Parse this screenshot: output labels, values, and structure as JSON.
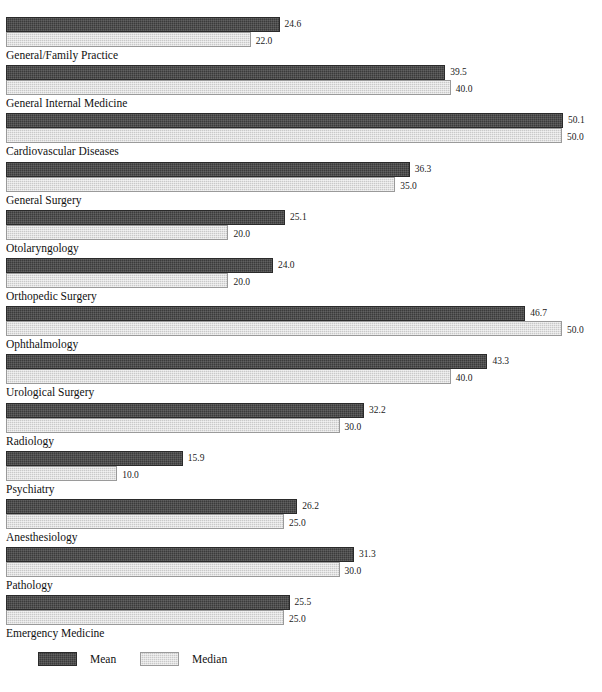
{
  "chart_data": {
    "type": "bar",
    "title": "",
    "subtitle": "",
    "xlabel": "",
    "ylabel": "",
    "orientation": "horizontal",
    "grid": false,
    "legend_position": "bottom-left",
    "xlim": [
      0,
      50.1
    ],
    "value_format": "one-decimal",
    "categories": [
      "General/Family Practice",
      "General Internal Medicine",
      "Cardiovascular Diseases",
      "General Surgery",
      "Otolaryngology",
      "Orthopedic Surgery",
      "Ophthalmology",
      "Urological Surgery",
      "Radiology",
      "Psychiatry",
      "Anesthesiology",
      "Pathology",
      "Emergency Medicine"
    ],
    "series": [
      {
        "name": "Mean",
        "color": "#3b3b3b",
        "values": [
          24.6,
          39.5,
          50.1,
          36.3,
          25.1,
          24.0,
          46.7,
          43.3,
          32.2,
          15.9,
          26.2,
          31.3,
          25.5
        ],
        "labels": [
          "24.6",
          "39.5",
          "50.1",
          "36.3",
          "25.1",
          "24.0",
          "46.7",
          "43.3",
          "32.2",
          "15.9",
          "26.2",
          "31.3",
          "25.5"
        ]
      },
      {
        "name": "Median",
        "color": "#c9c9c9",
        "values": [
          22.0,
          40.0,
          50.0,
          35.0,
          20.0,
          20.0,
          50.0,
          40.0,
          30.0,
          10.0,
          25.0,
          30.0,
          25.0
        ],
        "labels": [
          "22.0",
          "40.0",
          "50.0",
          "35.0",
          "20.0",
          "20.0",
          "50.0",
          "40.0",
          "30.0",
          "10.0",
          "25.0",
          "30.0",
          "25.0"
        ]
      }
    ],
    "legend": [
      {
        "label": "Mean",
        "color": "#3b3b3b"
      },
      {
        "label": "Median",
        "color": "#c9c9c9"
      }
    ]
  }
}
